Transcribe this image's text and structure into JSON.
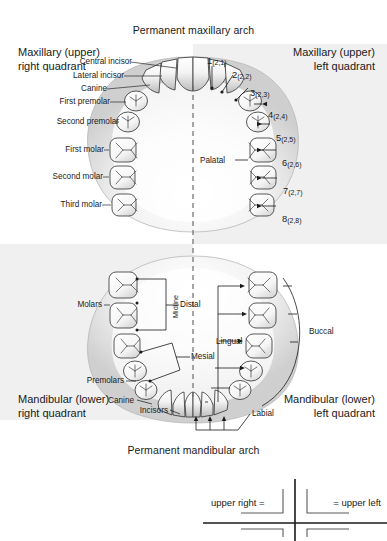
{
  "titles": {
    "maxillary_arch": "Permanent maxillary arch",
    "mandibular_arch": "Permanent mandibular arch"
  },
  "quadrants": {
    "upper_right": {
      "line1": "Maxillary (upper)",
      "line2": "right quadrant"
    },
    "upper_left": {
      "line1": "Maxillary (upper)",
      "line2": "left quadrant"
    },
    "lower_right": {
      "line1": "Mandibular (lower)",
      "line2": "right quadrant"
    },
    "lower_left": {
      "line1": "Mandibular (lower)",
      "line2": "left quadrant"
    }
  },
  "midline_label": "Midline",
  "upper_right_tooth_names": [
    "Central incisor",
    "Lateral incisor",
    "Canine",
    "First premolar",
    "Second premolar",
    "First molar",
    "Second molar",
    "Third molar"
  ],
  "upper_left_tooth_numbers": [
    {
      "number": "1",
      "fdi": "(2,1)"
    },
    {
      "number": "2",
      "fdi": "(2,2)"
    },
    {
      "number": "3",
      "fdi": "(2,3)"
    },
    {
      "number": "4",
      "fdi": "(2,4)"
    },
    {
      "number": "5",
      "fdi": "(2,5)"
    },
    {
      "number": "6",
      "fdi": "(2,6)"
    },
    {
      "number": "7",
      "fdi": "(2,7)"
    },
    {
      "number": "8",
      "fdi": "(2,8)"
    }
  ],
  "surface_labels": {
    "palatal": "Palatal",
    "lingual": "Lingual",
    "buccal": "Buccal",
    "labial": "Labial",
    "distal": "Distal",
    "mesial": "Mesial"
  },
  "lower_group_labels": {
    "molars": "Molars",
    "premolars": "Premolars",
    "canine": "Canine",
    "incisors": "Incisors"
  },
  "legend": {
    "upper_right": "upper right =",
    "upper_left": "= upper left"
  },
  "colors": {
    "panel_shaded": "#f0f0f0",
    "panel_plain": "#ffffff",
    "gum": "#d9d9d9",
    "tooth_fill": "#fbfbfb",
    "tooth_stroke": "#3b3b3b",
    "text": "#1a1a1a"
  }
}
